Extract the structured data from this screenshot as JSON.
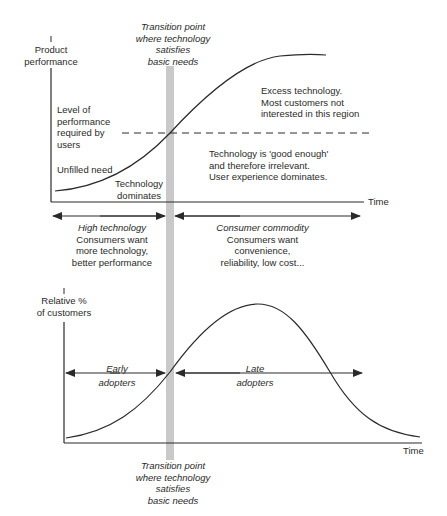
{
  "top_chart": {
    "y_axis_label": [
      "Product",
      "performance"
    ],
    "x_axis_label": "Time",
    "transition_label": [
      "Transition point",
      "where technology",
      "satisfies",
      "basic needs"
    ],
    "required_level_label": [
      "Level of",
      "performance",
      "required by",
      "users"
    ],
    "unfilled_need_label": "Unfilled need",
    "technology_dominates_label": [
      "Technology",
      "dominates"
    ],
    "excess_label": [
      "Excess technology.",
      "Most customers not",
      "interested in this region"
    ],
    "good_enough_label": [
      "Technology is 'good enough'",
      "and therefore irrelevant.",
      "User experience dominates."
    ]
  },
  "phases": {
    "left": {
      "title": "High technology",
      "lines": [
        "Consumers want",
        "more technology,",
        "better performance"
      ]
    },
    "right": {
      "title": "Consumer commodity",
      "lines": [
        "Consumers want",
        "convenience,",
        "reliability, low cost..."
      ]
    }
  },
  "bottom_chart": {
    "y_axis_label": [
      "Relative %",
      "of customers"
    ],
    "x_axis_label": "Time",
    "early_label": [
      "Early",
      "adopters"
    ],
    "late_label": [
      "Late",
      "adopters"
    ],
    "transition_label": [
      "Transition point",
      "where technology",
      "satisfies",
      "basic needs"
    ]
  },
  "colors": {
    "line": "#2a2a2a",
    "band": "#c8c8c8"
  }
}
